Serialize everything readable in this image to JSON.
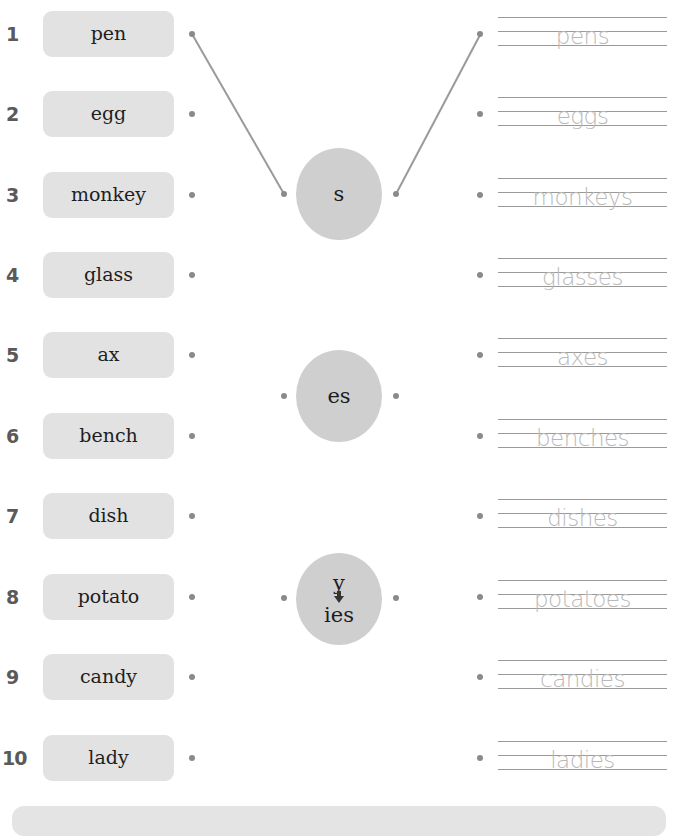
{
  "exercise": {
    "rows": [
      {
        "number": "1",
        "word": "pen",
        "answer": "pens"
      },
      {
        "number": "2",
        "word": "egg",
        "answer": "eggs"
      },
      {
        "number": "3",
        "word": "monkey",
        "answer": "monkeys"
      },
      {
        "number": "4",
        "word": "glass",
        "answer": "glasses"
      },
      {
        "number": "5",
        "word": "ax",
        "answer": "axes"
      },
      {
        "number": "6",
        "word": "bench",
        "answer": "benches"
      },
      {
        "number": "7",
        "word": "dish",
        "answer": "dishes"
      },
      {
        "number": "8",
        "word": "potato",
        "answer": "potatoes"
      },
      {
        "number": "9",
        "word": "candy",
        "answer": "candies"
      },
      {
        "number": "10",
        "word": "lady",
        "answer": "ladies"
      }
    ],
    "suffix_circles": [
      {
        "label": "s"
      },
      {
        "label": "es"
      },
      {
        "label_top": "y",
        "label_bottom": "ies",
        "icon": "down-arrow-icon"
      }
    ],
    "connections": [
      {
        "from": "word-1",
        "to": "circle-s"
      },
      {
        "from": "circle-s",
        "to": "answer-1"
      }
    ]
  },
  "colors": {
    "word_box_bg": "#e2e2e2",
    "circle_bg": "#cfcfcf",
    "answer_text": "#b9b9b9",
    "dot": "#8a8a8a",
    "number": "#5a5a5a"
  }
}
